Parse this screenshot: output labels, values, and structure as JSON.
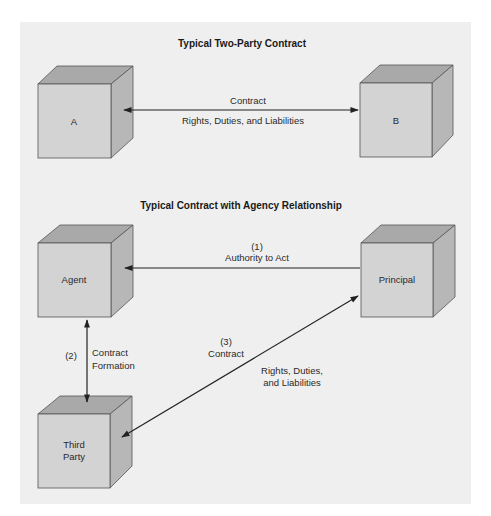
{
  "diagram": {
    "top_section": {
      "title": "Typical Two-Party Contract",
      "nodes": {
        "a": {
          "label": "A"
        },
        "b": {
          "label": "B"
        }
      },
      "edge": {
        "label_above": "Contract",
        "label_below": "Rights, Duties, and Liabilities",
        "direction": "bidirectional"
      }
    },
    "bottom_section": {
      "title": "Typical Contract with Agency Relationship",
      "nodes": {
        "agent": {
          "label": "Agent"
        },
        "principal": {
          "label": "Principal"
        },
        "third_party": {
          "line1": "Third",
          "line2": "Party"
        }
      },
      "edges": {
        "authority": {
          "number": "(1)",
          "label": "Authority to Act",
          "from": "Principal",
          "to": "Agent"
        },
        "formation": {
          "number": "(2)",
          "line1": "Contract",
          "line2": "Formation",
          "between": [
            "Agent",
            "Third Party"
          ]
        },
        "contract": {
          "number": "(3)",
          "label": "Contract",
          "rights_line1": "Rights, Duties,",
          "rights_line2": "and Liabilities",
          "between": [
            "Third Party",
            "Principal"
          ]
        }
      }
    },
    "colors": {
      "panel_bg": "#efefef",
      "box_front": "#d3d3d3",
      "box_top": "#a9a9a9",
      "box_side": "#b7b7b7",
      "line": "#222222"
    }
  }
}
